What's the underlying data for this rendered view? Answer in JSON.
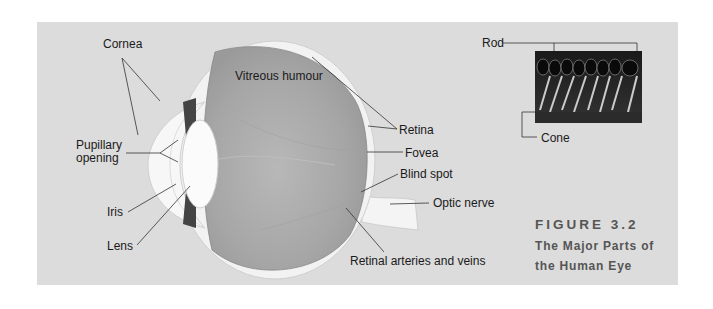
{
  "figure": {
    "number": "FIGURE 3.2",
    "title_line1": "The Major Parts of",
    "title_line2": "the Human Eye"
  },
  "labels": {
    "cornea": "Cornea",
    "vitreous_humour": "Vitreous humour",
    "pupillary_opening_line1": "Pupillary",
    "pupillary_opening_line2": "opening",
    "iris": "Iris",
    "lens": "Lens",
    "retina": "Retina",
    "fovea": "Fovea",
    "blind_spot": "Blind spot",
    "optic_nerve": "Optic nerve",
    "retinal_arteries_and_veins": "Retinal arteries and veins",
    "rod": "Rod",
    "cone": "Cone"
  },
  "colors": {
    "panel_background": "#dcdcdc",
    "eyeball_interior": "#a9a9a9",
    "sclera": "#f2f2f2",
    "label_text": "#1a1a1a",
    "caption_text": "#555555"
  }
}
